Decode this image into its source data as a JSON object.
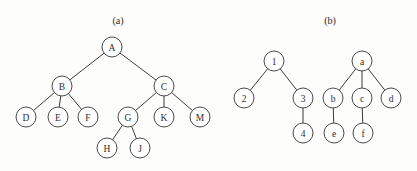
{
  "figure": {
    "background_color": "#fdfdfc",
    "stroke_color": "#4a4a4a",
    "edge_color": "#3a3a3a",
    "label_color": "#2e2e2e",
    "node_fill": "#ffffff",
    "node_radius": 10,
    "width": 417,
    "height": 171
  },
  "panels": [
    {
      "id": "panel-a",
      "caption": "(a)",
      "caption_x": 118,
      "caption_y": 20,
      "trees": [
        {
          "id": "tree-a-main",
          "root": "A",
          "nodes": [
            {
              "label": "A",
              "x": 112,
              "y": 47
            },
            {
              "label": "B",
              "x": 62,
              "y": 86
            },
            {
              "label": "C",
              "x": 164,
              "y": 86
            },
            {
              "label": "D",
              "x": 26,
              "y": 117
            },
            {
              "label": "E",
              "x": 58,
              "y": 117
            },
            {
              "label": "F",
              "x": 88,
              "y": 117
            },
            {
              "label": "G",
              "x": 128,
              "y": 117
            },
            {
              "label": "K",
              "x": 164,
              "y": 117
            },
            {
              "label": "M",
              "x": 200,
              "y": 117
            },
            {
              "label": "H",
              "x": 107,
              "y": 148
            },
            {
              "label": "J",
              "x": 140,
              "y": 148
            }
          ],
          "edges": [
            {
              "from": "A",
              "to": "B"
            },
            {
              "from": "A",
              "to": "C"
            },
            {
              "from": "B",
              "to": "D"
            },
            {
              "from": "B",
              "to": "E"
            },
            {
              "from": "B",
              "to": "F"
            },
            {
              "from": "C",
              "to": "G"
            },
            {
              "from": "C",
              "to": "K"
            },
            {
              "from": "C",
              "to": "M"
            },
            {
              "from": "G",
              "to": "H"
            },
            {
              "from": "G",
              "to": "J"
            }
          ]
        }
      ]
    },
    {
      "id": "panel-b",
      "caption": "(b)",
      "caption_x": 330,
      "caption_y": 20,
      "trees": [
        {
          "id": "tree-b-numeric",
          "root": "1",
          "nodes": [
            {
              "label": "1",
              "x": 274,
              "y": 61
            },
            {
              "label": "2",
              "x": 244,
              "y": 98
            },
            {
              "label": "3",
              "x": 303,
              "y": 98
            },
            {
              "label": "4",
              "x": 303,
              "y": 133
            }
          ],
          "edges": [
            {
              "from": "1",
              "to": "2"
            },
            {
              "from": "1",
              "to": "3"
            },
            {
              "from": "3",
              "to": "4"
            }
          ]
        },
        {
          "id": "tree-b-alpha",
          "root": "a",
          "nodes": [
            {
              "label": "a",
              "x": 362,
              "y": 61
            },
            {
              "label": "b",
              "x": 333,
              "y": 98
            },
            {
              "label": "c",
              "x": 362,
              "y": 98
            },
            {
              "label": "d",
              "x": 391,
              "y": 98
            },
            {
              "label": "e",
              "x": 334,
              "y": 133
            },
            {
              "label": "f",
              "x": 363,
              "y": 133
            }
          ],
          "edges": [
            {
              "from": "a",
              "to": "b"
            },
            {
              "from": "a",
              "to": "c"
            },
            {
              "from": "a",
              "to": "d"
            },
            {
              "from": "b",
              "to": "e"
            },
            {
              "from": "c",
              "to": "f"
            }
          ]
        }
      ]
    }
  ]
}
